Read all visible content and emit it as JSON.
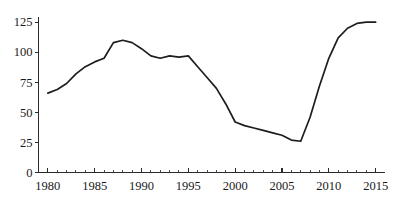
{
  "chart_data": {
    "type": "line",
    "title": "",
    "subtitle": "",
    "xlabel": "",
    "ylabel": "",
    "grid": false,
    "legend": false,
    "legend_position": "none",
    "xlim": [
      1979,
      2016
    ],
    "ylim": [
      0,
      131
    ],
    "x_ticks_major": [
      1980,
      1985,
      1990,
      1995,
      2000,
      2005,
      2010,
      2015
    ],
    "x_tick_labels": [
      "1980",
      "1985",
      "1990",
      "1995",
      "2000",
      "2005",
      "2010",
      "2015"
    ],
    "x_ticks_minor_step": 1,
    "y_ticks": [
      0,
      25,
      50,
      75,
      100,
      125
    ],
    "y_tick_labels": [
      "0",
      "25",
      "50",
      "75",
      "100",
      "125"
    ],
    "line_color": "#1d1d1d",
    "axis_color": "#2b2b2b",
    "background_color": "#ffffff",
    "x": [
      1980,
      1981,
      1982,
      1983,
      1984,
      1985,
      1986,
      1987,
      1988,
      1989,
      1990,
      1991,
      1992,
      1993,
      1994,
      1995,
      1996,
      1997,
      1998,
      1999,
      2000,
      2001,
      2002,
      2003,
      2004,
      2005,
      2006,
      2007,
      2008,
      2009,
      2010,
      2011,
      2012,
      2013,
      2014,
      2015
    ],
    "values": [
      66,
      69,
      74,
      82,
      88,
      92,
      95,
      108,
      110,
      108,
      103,
      97,
      95,
      97,
      96,
      97,
      88,
      79,
      70,
      57,
      42,
      39,
      37,
      35,
      33,
      31,
      27,
      26,
      46,
      72,
      95,
      112,
      120,
      124,
      125,
      125
    ],
    "series": [
      {
        "name": "series-1",
        "values": [
          66,
          69,
          74,
          82,
          88,
          92,
          95,
          108,
          110,
          108,
          103,
          97,
          95,
          97,
          96,
          97,
          88,
          79,
          70,
          57,
          42,
          39,
          37,
          35,
          33,
          31,
          27,
          26,
          46,
          72,
          95,
          112,
          120,
          124,
          125,
          125
        ]
      }
    ],
    "annotations": []
  }
}
